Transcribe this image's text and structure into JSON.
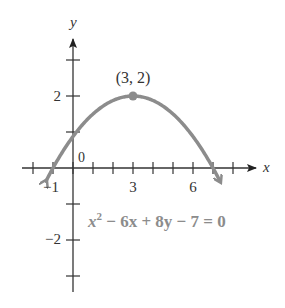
{
  "chart_data": {
    "type": "line",
    "title": "",
    "xlabel": "x",
    "ylabel": "y",
    "xlim": [
      -1.5,
      9
    ],
    "ylim": [
      -3.5,
      3.4
    ],
    "x_ticks": [
      -2,
      -1,
      0,
      1,
      2,
      3,
      4,
      5,
      6,
      7,
      8
    ],
    "x_tick_labels": [
      {
        "value": -1,
        "label": "−1"
      },
      {
        "value": 3,
        "label": "3"
      },
      {
        "value": 6,
        "label": "6"
      }
    ],
    "y_ticks": [
      -3,
      -2,
      -1,
      1,
      2,
      3
    ],
    "y_tick_labels": [
      {
        "value": 2,
        "label": "2"
      },
      {
        "value": -2,
        "label": "−2"
      }
    ],
    "origin_label": "0",
    "grid": false,
    "legend": null,
    "series": [
      {
        "name": "x^2 − 6x + 8y − 7 = 0",
        "equation": "y = (7 + 6x − x^2) / 8",
        "color": "#8c8c8c",
        "x": [
          -1.3,
          -1,
          0,
          1,
          2,
          3,
          4,
          5,
          6,
          7,
          7.3
        ],
        "y": [
          -0.2,
          0,
          0.875,
          1.5,
          1.875,
          2,
          1.875,
          1.5,
          0.875,
          0,
          -0.2
        ],
        "arrows_at_ends": true
      }
    ],
    "annotations": [
      {
        "type": "point",
        "x": 3,
        "y": 2,
        "label": "(3, 2)",
        "color": "#8c8c8c"
      },
      {
        "type": "text",
        "text_main": "x",
        "text_sup": "2",
        "text_rest": " − 6x + 8y − 7 = 0",
        "x": 0.6,
        "y": -1.45,
        "color": "#8c8c8c"
      }
    ]
  },
  "labels": {
    "x_axis": "x",
    "y_axis": "y",
    "origin": "0",
    "xt_m1": "−1",
    "xt_3": "3",
    "xt_6": "6",
    "yt_2": "2",
    "yt_m2": "−2",
    "vertex": "(3, 2)",
    "eq_x": "x",
    "eq_sup": "2",
    "eq_rest": " − 6x + 8y − 7 = 0"
  },
  "colors": {
    "axis": "#333333",
    "curve": "#8c8c8c",
    "equation": "#8c8c8c"
  }
}
